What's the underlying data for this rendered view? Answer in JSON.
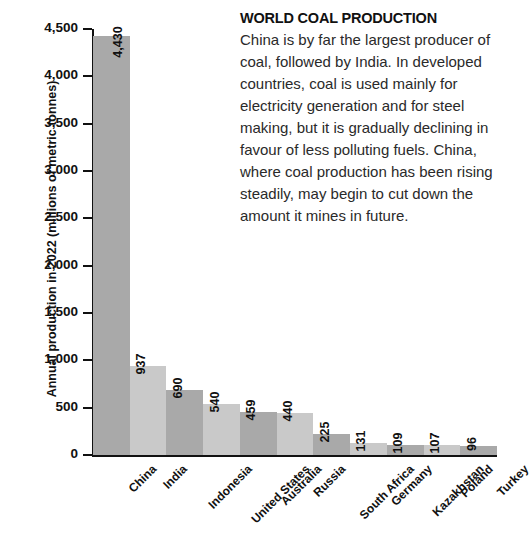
{
  "panel": {
    "title": "WORLD COAL PRODUCTION",
    "body": "China is by far the largest producer of coal, followed by India. In developed countries, coal is used mainly for electricity generation and for steel making, but it is gradually declining in favour of less polluting fuels. China, where coal production has been rising steadily, may begin to cut down the amount it mines in future."
  },
  "chart_data": {
    "type": "bar",
    "title": "",
    "xlabel": "",
    "ylabel": "Annual production in 2022 (millions of metric tonnes)",
    "ylim": [
      0,
      4500
    ],
    "ytick_values": [
      0,
      500,
      1000,
      1500,
      2000,
      2500,
      3000,
      3500,
      4000,
      4500
    ],
    "ytick_labels": [
      "0",
      "500",
      "1,000",
      "1,500",
      "2,000",
      "2,500",
      "3,000",
      "3,500",
      "4,000",
      "4,500"
    ],
    "grid": false,
    "legend": "none",
    "categories": [
      "China",
      "India",
      "Indonesia",
      "United States",
      "Australia",
      "Russia",
      "South Africa",
      "Germany",
      "Kazakhstan",
      "Poland",
      "Turkey"
    ],
    "values": [
      4430,
      937,
      690,
      540,
      459,
      440,
      225,
      131,
      109,
      107,
      96
    ],
    "value_labels": [
      "4,430",
      "937",
      "690",
      "540",
      "459",
      "440",
      "225",
      "131",
      "109",
      "107",
      "96"
    ],
    "bar_colors": [
      "#a9a9a9",
      "#c9c9c9",
      "#a9a9a9",
      "#c9c9c9",
      "#a9a9a9",
      "#c9c9c9",
      "#a9a9a9",
      "#c9c9c9",
      "#a9a9a9",
      "#c9c9c9",
      "#a9a9a9"
    ]
  }
}
